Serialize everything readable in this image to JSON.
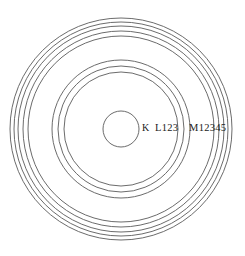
{
  "figure": {
    "background_color": "#ffffff",
    "line_color": "#5a5a5a",
    "text_color": "#1a1a1a",
    "center": {
      "x": 121,
      "y": 129
    }
  },
  "labels": {
    "k": "K",
    "l": "L123",
    "m": "M12345"
  },
  "chart_data": {
    "type": "diagram",
    "center_x": 121,
    "center_y": 129,
    "shells": [
      {
        "name": "K",
        "label": "K",
        "subshell_count": 1,
        "radii": [
          18
        ],
        "label_x": 142,
        "label_y": 129
      },
      {
        "name": "L",
        "label": "L123",
        "subshell_count": 3,
        "radii": [
          57,
          63,
          69
        ],
        "label_x": 155,
        "label_y": 129
      },
      {
        "name": "M",
        "label": "M12345",
        "subshell_count": 5,
        "radii": [
          93,
          98,
          103,
          107,
          111
        ],
        "label_x": 189,
        "label_y": 129
      }
    ]
  }
}
